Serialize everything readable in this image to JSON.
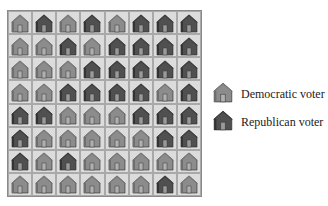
{
  "legend": {
    "democratic": {
      "label": "Democratic voter",
      "icon": "house-light-icon",
      "color": "#8c8c8c"
    },
    "republican": {
      "label": "Republican voter",
      "icon": "house-dark-icon",
      "color": "#505050"
    }
  },
  "grid": {
    "rows": 8,
    "cols": 8,
    "cells": [
      [
        "D",
        "R",
        "D",
        "R",
        "D",
        "R",
        "R",
        "R"
      ],
      [
        "D",
        "D",
        "R",
        "D",
        "R",
        "R",
        "R",
        "R"
      ],
      [
        "D",
        "D",
        "D",
        "R",
        "R",
        "R",
        "R",
        "R"
      ],
      [
        "D",
        "D",
        "R",
        "R",
        "R",
        "R",
        "D",
        "R"
      ],
      [
        "R",
        "R",
        "D",
        "D",
        "D",
        "R",
        "R",
        "R"
      ],
      [
        "R",
        "D",
        "D",
        "D",
        "D",
        "D",
        "R",
        "R"
      ],
      [
        "R",
        "D",
        "R",
        "D",
        "D",
        "D",
        "D",
        "D"
      ],
      [
        "D",
        "D",
        "D",
        "D",
        "D",
        "D",
        "R",
        "D"
      ]
    ]
  }
}
